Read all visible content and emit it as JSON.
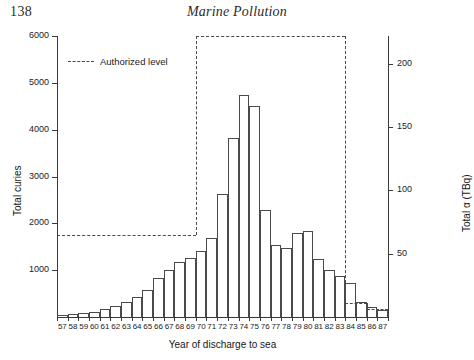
{
  "page": {
    "number": "138",
    "running_head": "Marine Pollution"
  },
  "legend": {
    "label": "Authorized level"
  },
  "chart_data": {
    "type": "bar",
    "title": "",
    "xlabel": "Year of discharge to sea",
    "ylabel": "Total curies",
    "ylabel_secondary": "Total α (TBq)",
    "ylim": [
      0,
      6000
    ],
    "ylim_secondary": [
      0,
      222
    ],
    "yticks": [
      1000,
      2000,
      3000,
      4000,
      5000,
      6000
    ],
    "yticklabels": [
      "1000",
      "2000",
      "3000",
      "4000",
      "5000",
      "6000"
    ],
    "yticks_secondary": [
      50,
      100,
      150,
      200
    ],
    "yticklabels_secondary": [
      "50",
      "100",
      "150",
      "200"
    ],
    "grid": false,
    "legend_position": "upper-left",
    "categories": [
      "57",
      "58",
      "59",
      "60",
      "61",
      "62",
      "63",
      "64",
      "65",
      "66",
      "67",
      "68",
      "69",
      "70",
      "71",
      "72",
      "73",
      "74",
      "75",
      "76",
      "77",
      "78",
      "79",
      "80",
      "81",
      "82",
      "83",
      "84",
      "85",
      "86",
      "87"
    ],
    "values": [
      40,
      70,
      95,
      100,
      175,
      230,
      310,
      430,
      580,
      830,
      1000,
      1180,
      1270,
      1420,
      1690,
      2630,
      3820,
      4750,
      4500,
      2280,
      1540,
      1480,
      1790,
      1830,
      1230,
      1010,
      880,
      720,
      320,
      210,
      150
    ],
    "annotations": [
      {
        "name": "authorized-level",
        "style": "dashed",
        "steps": [
          {
            "from_year": "57",
            "to_year": "70",
            "value": 1750
          },
          {
            "from_year": "70",
            "to_year": "84",
            "value": 6000
          },
          {
            "from_year": "84",
            "to_year": "86",
            "value": 300
          },
          {
            "from_year": "86",
            "to_year": "87",
            "value": 180
          }
        ]
      }
    ]
  }
}
